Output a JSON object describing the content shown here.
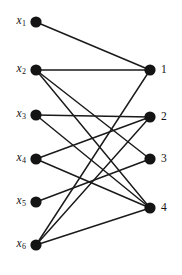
{
  "figure": {
    "type": "bipartite-graph",
    "width": 182,
    "height": 275,
    "background_color": "#ffffff",
    "node_color": "#141414",
    "edge_color": "#1a1a1a",
    "node_radius": 5.6,
    "edge_width": 1.45
  },
  "left_nodes": [
    {
      "id": "x1",
      "label_base": "x",
      "label_sub": "1",
      "x": 36,
      "y": 22
    },
    {
      "id": "x2",
      "label_base": "x",
      "label_sub": "2",
      "x": 36,
      "y": 70
    },
    {
      "id": "x3",
      "label_base": "x",
      "label_sub": "3",
      "x": 36,
      "y": 115
    },
    {
      "id": "x4",
      "label_base": "x",
      "label_sub": "4",
      "x": 36,
      "y": 159
    },
    {
      "id": "x5",
      "label_base": "x",
      "label_sub": "5",
      "x": 36,
      "y": 202
    },
    {
      "id": "x6",
      "label_base": "x",
      "label_sub": "6",
      "x": 36,
      "y": 245
    }
  ],
  "right_nodes": [
    {
      "id": "1",
      "label": "1",
      "x": 150,
      "y": 70
    },
    {
      "id": "2",
      "label": "2",
      "x": 150,
      "y": 117
    },
    {
      "id": "3",
      "label": "3",
      "x": 150,
      "y": 159
    },
    {
      "id": "4",
      "label": "4",
      "x": 150,
      "y": 208
    }
  ],
  "edges": [
    {
      "from": "x1",
      "to": "1"
    },
    {
      "from": "x2",
      "to": "1"
    },
    {
      "from": "x2",
      "to": "3"
    },
    {
      "from": "x2",
      "to": "4"
    },
    {
      "from": "x3",
      "to": "2"
    },
    {
      "from": "x3",
      "to": "4"
    },
    {
      "from": "x4",
      "to": "2"
    },
    {
      "from": "x4",
      "to": "4"
    },
    {
      "from": "x5",
      "to": "3"
    },
    {
      "from": "x6",
      "to": "1"
    },
    {
      "from": "x6",
      "to": "2"
    },
    {
      "from": "x6",
      "to": "4"
    }
  ]
}
